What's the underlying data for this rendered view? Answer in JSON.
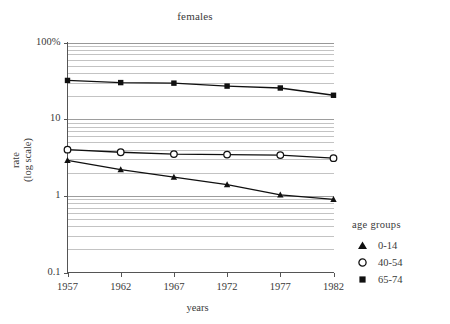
{
  "chart_data": {
    "type": "line",
    "title": "females",
    "xlabel": "years",
    "ylabel": "rate (log scale)",
    "ylabel_line1": "rate",
    "ylabel_line2": "(log scale)",
    "x": [
      1957,
      1962,
      1967,
      1972,
      1977,
      1982
    ],
    "xtick_labels": [
      "1957",
      "1962",
      "1967",
      "1972",
      "1977",
      "1982"
    ],
    "ytick_labels": [
      "100%",
      "10",
      "1",
      "0.1"
    ],
    "ytick_values": [
      100,
      10,
      1,
      0.1
    ],
    "ylim": [
      0.1,
      100
    ],
    "yscale": "log",
    "grid": "horizontal-minor-log",
    "legend_position": "right",
    "legend_title": "age groups",
    "series": [
      {
        "name": "0-14",
        "marker": "filled-triangle",
        "color": "#101010",
        "values": [
          2.9,
          2.2,
          1.75,
          1.4,
          1.03,
          0.9
        ]
      },
      {
        "name": "40-54",
        "marker": "open-circle",
        "color": "#101010",
        "values": [
          4.0,
          3.7,
          3.5,
          3.45,
          3.4,
          3.1
        ]
      },
      {
        "name": "65-74",
        "marker": "filled-square",
        "color": "#101010",
        "values": [
          32.0,
          30.0,
          29.5,
          27.0,
          25.5,
          20.5
        ]
      }
    ]
  },
  "legend": {
    "title": "age groups",
    "entries": [
      {
        "label": "0-14",
        "marker": "filled-triangle"
      },
      {
        "label": "40-54",
        "marker": "open-circle"
      },
      {
        "label": "65-74",
        "marker": "filled-square"
      }
    ]
  },
  "axes": {
    "y_label_top": "100%",
    "y_label_mid_upper": "10",
    "y_label_mid_lower": "1",
    "y_label_bottom": "0.1",
    "x_title": "years",
    "y_title_line1": "rate",
    "y_title_line2": "(log scale)"
  },
  "colors": {
    "ink": "#2b2b2b",
    "gridline": "#8d8d8d",
    "axis": "#555555",
    "series": "#101010",
    "background": "#ffffff"
  }
}
